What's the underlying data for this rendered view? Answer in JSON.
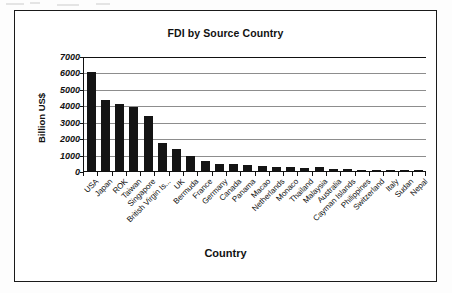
{
  "chart_data": {
    "type": "bar",
    "title": "FDI by Source Country",
    "xlabel": "Country",
    "ylabel": "Billion US$",
    "ylim": [
      0,
      7000
    ],
    "yticks": [
      7000,
      6000,
      5000,
      4000,
      3000,
      2000,
      1000,
      0
    ],
    "grid": true,
    "legend": "none",
    "bar_color": "#141414",
    "categories": [
      "USA",
      "Japan",
      "ROK",
      "Taiwan",
      "Singapore",
      "British Virgin Is...",
      "UK",
      "Bermuda",
      "France",
      "Germany",
      "Canada",
      "Panama",
      "Macao",
      "Netherlands",
      "Monaco",
      "Thailand",
      "Malaysia",
      "Australia",
      "Cayman Islands",
      "Philippines",
      "Switzerland",
      "Italy",
      "Sudan",
      "Nepal"
    ],
    "values": [
      6050,
      4350,
      4050,
      3920,
      3320,
      1680,
      1340,
      920,
      610,
      420,
      400,
      340,
      320,
      250,
      230,
      170,
      230,
      150,
      110,
      90,
      60,
      30,
      20,
      10
    ]
  },
  "axis": {
    "y_tick_labels": [
      "7000",
      "6000",
      "5000",
      "4000",
      "3000",
      "2000",
      "1000",
      "0"
    ]
  }
}
